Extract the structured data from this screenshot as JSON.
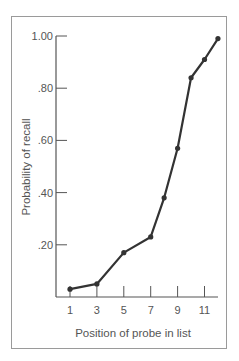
{
  "chart_data": {
    "type": "line",
    "title": "",
    "xlabel": "Position of probe in list",
    "ylabel": "Probability of recall",
    "x_ticks": [
      "1",
      "3",
      "5",
      "7",
      "9",
      "11"
    ],
    "y_ticks": [
      "1.00",
      ".80",
      ".60",
      ".40",
      ".20"
    ],
    "xlim": [
      0.5,
      12.5
    ],
    "ylim": [
      0,
      1.0
    ],
    "grid": false,
    "legend": null,
    "series": [
      {
        "name": "Probability of recall",
        "x": [
          1,
          3,
          5,
          7,
          8,
          9,
          10,
          11,
          12
        ],
        "values": [
          0.03,
          0.05,
          0.17,
          0.23,
          0.38,
          0.57,
          0.84,
          0.91,
          0.99
        ],
        "color": "#333333",
        "marker": "circle"
      }
    ]
  }
}
